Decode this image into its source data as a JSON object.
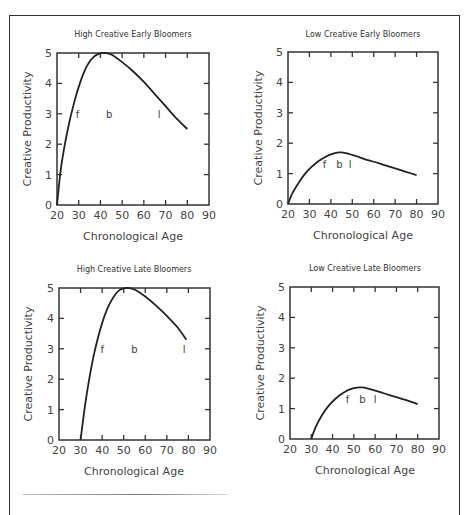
{
  "chart_data": [
    {
      "type": "line",
      "title": "High Creative Early Bloomers",
      "xlabel": "Chronological Age",
      "ylabel": "Creative Productivity",
      "xlim": [
        20,
        90
      ],
      "ylim": [
        0,
        5
      ],
      "xticks": [
        20,
        30,
        40,
        50,
        60,
        70,
        80,
        90
      ],
      "yticks": [
        0,
        1,
        2,
        3,
        4,
        5
      ],
      "grid": false,
      "series": [
        {
          "name": "productivity",
          "x": [
            20,
            22,
            25,
            28,
            31,
            34,
            37,
            40,
            42,
            45,
            50,
            55,
            60,
            65,
            70,
            75,
            80
          ],
          "y": [
            0,
            1.3,
            2.5,
            3.4,
            4.1,
            4.6,
            4.88,
            4.99,
            5.0,
            4.95,
            4.7,
            4.4,
            4.05,
            3.65,
            3.25,
            2.85,
            2.5
          ]
        }
      ],
      "annotations": [
        {
          "text": "f",
          "x": 29.5,
          "y": 3
        },
        {
          "text": "b",
          "x": 44,
          "y": 3
        },
        {
          "text": "l",
          "x": 67,
          "y": 3
        }
      ]
    },
    {
      "type": "line",
      "title": "Low Creative Early Bloomers",
      "xlabel": "Chronological Age",
      "ylabel": "Creative Productivity",
      "xlim": [
        20,
        90
      ],
      "ylim": [
        0,
        5
      ],
      "xticks": [
        20,
        30,
        40,
        50,
        60,
        70,
        80,
        90
      ],
      "yticks": [
        0,
        1,
        2,
        3,
        4,
        5
      ],
      "grid": false,
      "series": [
        {
          "name": "productivity",
          "x": [
            20,
            22,
            25,
            28,
            31,
            34,
            37,
            40,
            43,
            45,
            48,
            52,
            56,
            60,
            65,
            70,
            75,
            80
          ],
          "y": [
            0,
            0.35,
            0.7,
            1.0,
            1.22,
            1.4,
            1.53,
            1.63,
            1.69,
            1.7,
            1.66,
            1.57,
            1.47,
            1.39,
            1.28,
            1.17,
            1.06,
            0.95
          ]
        }
      ],
      "annotations": [
        {
          "text": "f",
          "x": 37,
          "y": 1.3
        },
        {
          "text": "b",
          "x": 44,
          "y": 1.3
        },
        {
          "text": "l",
          "x": 49,
          "y": 1.3
        }
      ]
    },
    {
      "type": "line",
      "title": "High Creative Late Bloomers",
      "xlabel": "Chronological Age",
      "ylabel": "Creative Productivity",
      "xlim": [
        20,
        90
      ],
      "ylim": [
        0,
        5
      ],
      "xticks": [
        20,
        30,
        40,
        50,
        60,
        70,
        80,
        90
      ],
      "yticks": [
        0,
        1,
        2,
        3,
        4,
        5
      ],
      "grid": false,
      "series": [
        {
          "name": "productivity",
          "x": [
            30,
            32,
            34,
            36,
            38,
            40,
            42,
            44,
            46,
            48,
            50,
            52,
            55,
            60,
            65,
            70,
            75,
            79
          ],
          "y": [
            0,
            1.1,
            2.0,
            2.75,
            3.35,
            3.85,
            4.25,
            4.55,
            4.78,
            4.93,
            4.99,
            5.0,
            4.95,
            4.72,
            4.42,
            4.08,
            3.7,
            3.3
          ]
        }
      ],
      "annotations": [
        {
          "text": "f",
          "x": 40,
          "y": 3
        },
        {
          "text": "b",
          "x": 55,
          "y": 3
        },
        {
          "text": "l",
          "x": 78,
          "y": 3
        }
      ]
    },
    {
      "type": "line",
      "title": "Low Creative Late Bloomers",
      "xlabel": "Chronological Age",
      "ylabel": "Creative Productivity",
      "xlim": [
        20,
        90
      ],
      "ylim": [
        0,
        5
      ],
      "xticks": [
        20,
        30,
        40,
        50,
        60,
        70,
        80,
        90
      ],
      "yticks": [
        0,
        1,
        2,
        3,
        4,
        5
      ],
      "grid": false,
      "series": [
        {
          "name": "productivity",
          "x": [
            30,
            32,
            35,
            38,
            41,
            44,
            47,
            50,
            53,
            55,
            58,
            62,
            66,
            70,
            75,
            80
          ],
          "y": [
            0,
            0.38,
            0.78,
            1.08,
            1.3,
            1.47,
            1.6,
            1.67,
            1.7,
            1.69,
            1.63,
            1.55,
            1.46,
            1.38,
            1.27,
            1.15
          ]
        }
      ],
      "annotations": [
        {
          "text": "f",
          "x": 47,
          "y": 1.3
        },
        {
          "text": "b",
          "x": 54,
          "y": 1.3
        },
        {
          "text": "l",
          "x": 60,
          "y": 1.3
        }
      ]
    }
  ],
  "panels": [
    {
      "title": "High Creative Early Bloomers",
      "xlabel": "Chronological Age",
      "ylabel": "Creative Productivity"
    },
    {
      "title": "Low Creative Early Bloomers",
      "xlabel": "Chronological Age",
      "ylabel": "Creative Productivity"
    },
    {
      "title": "High Creative Late Bloomers",
      "xlabel": "Chronological Age",
      "ylabel": "Creative Productivity"
    },
    {
      "title": "Low Creative Late Bloomers",
      "xlabel": "Chronological Age",
      "ylabel": "Creative Productivity"
    }
  ],
  "colors": {
    "line": "#222222",
    "axis": "#333333",
    "text": "#444444"
  }
}
